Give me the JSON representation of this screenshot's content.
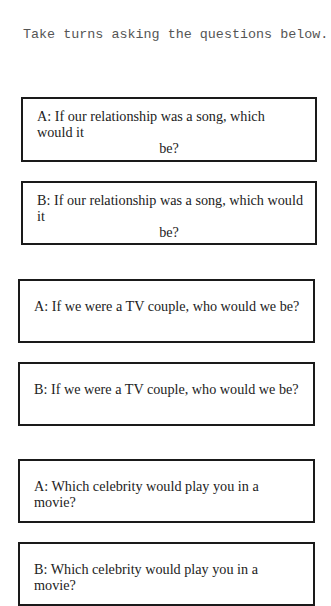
{
  "instructions": "Take turns asking the questions below.",
  "questions": [
    {
      "label": "A: If our relationship was a song, which would it be?",
      "line1": "A: If our relationship was a song, which would it",
      "line2": "be?"
    },
    {
      "label": "B: If our relationship was a song, which would it be?",
      "line1": "B: If our relationship was a song, which would it",
      "line2": "be?"
    },
    {
      "label": "A: If we were a TV couple, who would we be?"
    },
    {
      "label": "B: If we were a TV couple, who would we be?"
    },
    {
      "label": "A: Which celebrity would play you in a movie?"
    },
    {
      "label": "B: Which celebrity would play you in a movie?"
    }
  ]
}
